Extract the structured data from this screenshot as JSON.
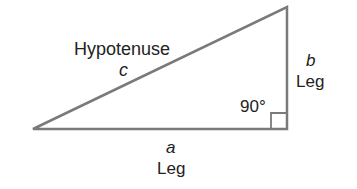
{
  "diagram": {
    "type": "right-triangle",
    "stroke_color": "#7a7a7a",
    "text_color": "#222222",
    "vertices": {
      "left": [
        33,
        129
      ],
      "apex": [
        287,
        7
      ],
      "right_angle": [
        287,
        129
      ]
    },
    "hypotenuse": {
      "name": "Hypotenuse",
      "variable": "c"
    },
    "vertical_leg": {
      "variable": "b",
      "name": "Leg"
    },
    "horizontal_leg": {
      "variable": "a",
      "name": "Leg"
    },
    "angle": {
      "label": "90°"
    }
  }
}
